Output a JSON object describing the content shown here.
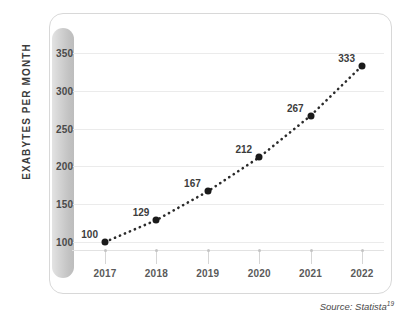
{
  "chart_data": {
    "type": "line",
    "title": "",
    "subtitle": "",
    "xlabel": "",
    "ylabel": "EXABYTES PER MONTH",
    "categories": [
      "2017",
      "2018",
      "2019",
      "2020",
      "2021",
      "2022"
    ],
    "values": [
      100,
      129,
      167,
      212,
      267,
      333
    ],
    "point_labels": [
      "100",
      "129",
      "167",
      "212",
      "267",
      "333"
    ],
    "ylim": [
      62,
      350
    ],
    "y_ticks": [
      100,
      150,
      200,
      250,
      300,
      350
    ],
    "y_tick_labels": [
      "100",
      "150",
      "200",
      "250",
      "300",
      "350"
    ],
    "x_tick_labels": [
      "2017",
      "2018",
      "2019",
      "2020",
      "2021",
      "2022"
    ],
    "grid": true,
    "legend": "none",
    "line_style": "dotted",
    "marker": "circle",
    "series": [
      {
        "name": "Mobile data traffic",
        "values": [
          100,
          129,
          167,
          212,
          267,
          333
        ]
      }
    ]
  },
  "source": {
    "text": "Source: Statista",
    "superscript": "19"
  },
  "colors": {
    "marker": "#1a1a1a",
    "line": "#2b2b2b",
    "grid": "#ebebeb",
    "axis_pill": "#cfcfcf",
    "axis_pill_shadow": "#111111",
    "frame": "#d8d8d8",
    "label_text": "#3c3c3c",
    "background": "#ffffff"
  }
}
